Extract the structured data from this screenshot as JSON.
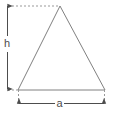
{
  "figure": {
    "kind": "geometry-diagram",
    "shape": "isosceles-triangle",
    "background_color": "#ffffff",
    "canvas": {
      "width": 113,
      "height": 124
    },
    "stroke_color": "#808080",
    "dimension_color": "#4d4d4d",
    "dotted_color": "#999999",
    "labels": {
      "height": "h",
      "base": "a"
    },
    "geometry": {
      "apex": {
        "x": 60,
        "y": 6
      },
      "bottom_left": {
        "x": 18,
        "y": 90
      },
      "bottom_right": {
        "x": 105,
        "y": 90
      },
      "height_dimension_x": 7,
      "height_dimension_top_y": 5,
      "height_dimension_bottom_y": 90,
      "base_dimension_y": 103,
      "base_dimension_left_x": 18,
      "base_dimension_right_x": 105
    }
  }
}
